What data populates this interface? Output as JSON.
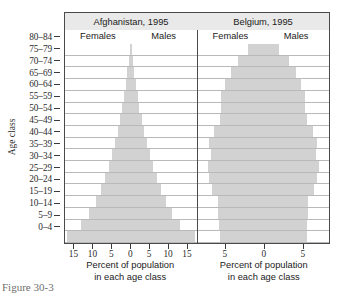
{
  "figure": {
    "caption": "Figure  30-3"
  },
  "axes": {
    "ylabel": "Age class",
    "xtitle_line1": "Percent of population",
    "xtitle_line2": "in each age class",
    "age_classes": [
      "80–84",
      "75–79",
      "70–74",
      "65–69",
      "60–64",
      "55–59",
      "50–54",
      "45–49",
      "40–44",
      "35–39",
      "30–34",
      "25–29",
      "20–24",
      "15–19",
      "10–14",
      "5–9",
      "0–4"
    ],
    "bar_color": "#d2d2d2",
    "frame_color": "#4a4a4a",
    "title_band_color": "#e9e9e9",
    "gridline_color": "#b9b9b9"
  },
  "panels": [
    {
      "title": "Afghanistan, 1995",
      "female_label": "Females",
      "male_label": "Males",
      "xticks": [
        15,
        10,
        5,
        0,
        5,
        10,
        15
      ],
      "xticklabels": [
        "15",
        "10",
        "5",
        "0",
        "5",
        "10",
        "15"
      ],
      "xmax": 17.5
    },
    {
      "title": "Belgium, 1995",
      "female_label": "Females",
      "male_label": "Males",
      "xticks": [
        5,
        0,
        5
      ],
      "xticklabels": [
        "5",
        "0",
        "5"
      ],
      "xmax": 8.5
    }
  ],
  "chart_data": {
    "type": "bar",
    "subtype": "population-pyramid",
    "title": "",
    "xlabel": "Percent of population in each age class",
    "ylabel": "Age class",
    "grid": true,
    "legend": "in-panel (Females left of center, Males right of center)",
    "categories": [
      "0–4",
      "5–9",
      "10–14",
      "15–19",
      "20–24",
      "25–29",
      "30–34",
      "35–39",
      "40–44",
      "45–49",
      "50–54",
      "55–59",
      "60–64",
      "65–69",
      "70–74",
      "75–79",
      "80–84"
    ],
    "panels": [
      {
        "name": "Afghanistan, 1995",
        "xlim": [
          -17.5,
          17.5
        ],
        "xticks": [
          15,
          10,
          5,
          0,
          5,
          10,
          15
        ],
        "series": [
          {
            "name": "Females",
            "side": "left",
            "values": [
              17.0,
              13.2,
              11.0,
              9.3,
              8.0,
              6.9,
              5.9,
              5.0,
              4.2,
              3.5,
              2.9,
              2.3,
              1.8,
              1.3,
              0.9,
              0.5,
              0.25
            ]
          },
          {
            "name": "Males",
            "side": "right",
            "values": [
              17.0,
              13.2,
              11.0,
              9.3,
              8.0,
              6.9,
              5.9,
              5.0,
              4.2,
              3.5,
              2.9,
              2.3,
              1.8,
              1.3,
              0.9,
              0.5,
              0.25
            ]
          }
        ]
      },
      {
        "name": "Belgium, 1995",
        "xlim": [
          -8.5,
          8.5
        ],
        "xticks": [
          5,
          0,
          5
        ],
        "series": [
          {
            "name": "Females",
            "side": "left",
            "values": [
              5.6,
              5.7,
              5.8,
              5.8,
              6.6,
              7.0,
              7.2,
              6.8,
              7.0,
              6.4,
              5.6,
              5.4,
              5.4,
              4.9,
              4.2,
              3.3,
              2.0
            ]
          },
          {
            "name": "Males",
            "side": "right",
            "values": [
              5.6,
              5.7,
              5.8,
              5.8,
              6.6,
              7.0,
              7.2,
              6.8,
              7.0,
              6.4,
              5.6,
              5.4,
              5.4,
              4.9,
              4.2,
              3.3,
              2.0
            ]
          }
        ]
      }
    ]
  }
}
